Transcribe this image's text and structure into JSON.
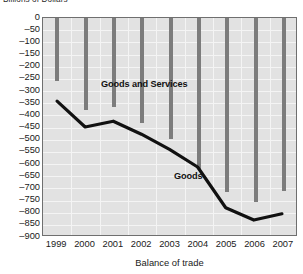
{
  "chart_data": {
    "type": "bar",
    "title": "Billions of Dollars",
    "xlabel": "Balance of trade",
    "ylabel": "Billions of Dollars",
    "categories": [
      "1999",
      "2000",
      "2001",
      "2002",
      "2003",
      "2004",
      "2005",
      "2006",
      "2007"
    ],
    "ylim": [
      -900,
      0
    ],
    "ytick_step": 50,
    "yticks": [
      0,
      -50,
      -100,
      -150,
      -200,
      -250,
      -300,
      -350,
      -400,
      -450,
      -500,
      -550,
      -600,
      -650,
      -700,
      -750,
      -800,
      -850,
      -900
    ],
    "ytick_labels": [
      "0",
      "–50",
      "–100",
      "–150",
      "–200",
      "–250",
      "–300",
      "–350",
      "–400",
      "–450",
      "–500",
      "–550",
      "–600",
      "–650",
      "–700",
      "–750",
      "–800",
      "–850",
      "–900"
    ],
    "grid": true,
    "legend_position": "inline-annotation",
    "series": [
      {
        "name": "Goods and Services",
        "render": "bar",
        "color": "#7c7c7c",
        "values": [
          -260,
          -380,
          -365,
          -430,
          -497,
          -620,
          -715,
          -755,
          -710
        ]
      },
      {
        "name": "Goods",
        "render": "line",
        "color": "#111111",
        "values": [
          -345,
          -452,
          -428,
          -482,
          -545,
          -618,
          -787,
          -838,
          -812
        ]
      }
    ],
    "annotations": [
      {
        "text": "Goods and Services",
        "series": "Goods and Services"
      },
      {
        "text": "Goods",
        "series": "Goods"
      }
    ]
  }
}
